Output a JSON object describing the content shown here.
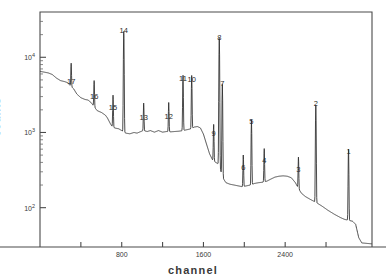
{
  "chart_data": {
    "type": "line",
    "title": "",
    "xlabel": "channel",
    "ylabel": "counts",
    "yscale": "log",
    "xlim": [
      0,
      3250
    ],
    "ylim": [
      30,
      40000
    ],
    "grid": false,
    "legend": null,
    "y_ticks": [
      {
        "value": 100,
        "label": "10",
        "exp": "2"
      },
      {
        "value": 1000,
        "label": "10",
        "exp": "3"
      },
      {
        "value": 10000,
        "label": "10",
        "exp": "4"
      }
    ],
    "y_minor_ticks": [
      200,
      300,
      400,
      500,
      600,
      700,
      800,
      900,
      2000,
      3000,
      4000,
      5000,
      6000,
      7000,
      8000,
      9000,
      20000,
      30000
    ],
    "x_ticks": [
      {
        "value": 400,
        "label": ""
      },
      {
        "value": 800,
        "label": "800"
      },
      {
        "value": 1200,
        "label": ""
      },
      {
        "value": 1600,
        "label": "1600"
      },
      {
        "value": 2000,
        "label": ""
      },
      {
        "value": 2400,
        "label": "2400"
      },
      {
        "value": 2800,
        "label": ""
      }
    ],
    "peaks": [
      {
        "id": "1",
        "channel": 3020,
        "height": 530,
        "label_y": 460
      },
      {
        "id": "2",
        "channel": 2700,
        "height": 2200,
        "label_y": 2000
      },
      {
        "id": "3",
        "channel": 2530,
        "height": 290,
        "label_y": 265
      },
      {
        "id": "4",
        "channel": 2195,
        "height": 390,
        "label_y": 350
      },
      {
        "id": "5",
        "channel": 2070,
        "height": 1280,
        "label_y": 1150
      },
      {
        "id": "6",
        "channel": 1990,
        "height": 310,
        "label_y": 280
      },
      {
        "id": "7",
        "channel": 1785,
        "height": 4100,
        "label_y": 3700
      },
      {
        "id": "8",
        "channel": 1755,
        "height": 17500,
        "label_y": 15000
      },
      {
        "id": "9",
        "channel": 1700,
        "height": 860,
        "label_y": 790
      },
      {
        "id": "10",
        "channel": 1485,
        "height": 4600,
        "label_y": 4150
      },
      {
        "id": "11",
        "channel": 1400,
        "height": 4700,
        "label_y": 4250
      },
      {
        "id": "12",
        "channel": 1260,
        "height": 1480,
        "label_y": 1350
      },
      {
        "id": "13",
        "channel": 1015,
        "height": 1400,
        "label_y": 1280
      },
      {
        "id": "14",
        "channel": 820,
        "height": 21000,
        "label_y": 18500
      },
      {
        "id": "15",
        "channel": 715,
        "height": 1960,
        "label_y": 1780
      },
      {
        "id": "16",
        "channel": 530,
        "height": 2700,
        "label_y": 2450
      },
      {
        "id": "17",
        "channel": 305,
        "height": 4250,
        "label_y": 3850
      }
    ],
    "continuum": [
      [
        0,
        6500
      ],
      [
        40,
        6350
      ],
      [
        80,
        6200
      ],
      [
        120,
        5900
      ],
      [
        160,
        5300
      ],
      [
        200,
        4900
      ],
      [
        240,
        4750
      ],
      [
        270,
        4600
      ],
      [
        300,
        4150
      ],
      [
        330,
        3800
      ],
      [
        360,
        3250
      ],
      [
        400,
        2900
      ],
      [
        440,
        2750
      ],
      [
        470,
        2700
      ],
      [
        500,
        2500
      ],
      [
        530,
        2200
      ],
      [
        560,
        1950
      ],
      [
        600,
        1850
      ],
      [
        640,
        1700
      ],
      [
        660,
        1560
      ],
      [
        690,
        1300
      ],
      [
        710,
        1180
      ],
      [
        740,
        1140
      ],
      [
        770,
        1120
      ],
      [
        800,
        1060
      ],
      [
        840,
        980
      ],
      [
        880,
        960
      ],
      [
        920,
        1000
      ],
      [
        950,
        980
      ],
      [
        980,
        1020
      ],
      [
        1010,
        1060
      ],
      [
        1050,
        1030
      ],
      [
        1080,
        1060
      ],
      [
        1120,
        1010
      ],
      [
        1160,
        1060
      ],
      [
        1200,
        1010
      ],
      [
        1240,
        1030
      ],
      [
        1280,
        1020
      ],
      [
        1320,
        1030
      ],
      [
        1360,
        1040
      ],
      [
        1400,
        1060
      ],
      [
        1440,
        1090
      ],
      [
        1480,
        1120
      ],
      [
        1510,
        1180
      ],
      [
        1540,
        1200
      ],
      [
        1570,
        1150
      ],
      [
        1600,
        950
      ],
      [
        1630,
        700
      ],
      [
        1660,
        520
      ],
      [
        1690,
        430
      ],
      [
        1720,
        400
      ],
      [
        1750,
        380
      ],
      [
        1790,
        250
      ],
      [
        1820,
        215
      ],
      [
        1860,
        205
      ],
      [
        1900,
        200
      ],
      [
        1940,
        195
      ],
      [
        1980,
        190
      ],
      [
        2020,
        195
      ],
      [
        2060,
        200
      ],
      [
        2100,
        210
      ],
      [
        2140,
        215
      ],
      [
        2180,
        218
      ],
      [
        2220,
        225
      ],
      [
        2260,
        240
      ],
      [
        2300,
        255
      ],
      [
        2340,
        262
      ],
      [
        2380,
        265
      ],
      [
        2420,
        262
      ],
      [
        2460,
        250
      ],
      [
        2500,
        215
      ],
      [
        2530,
        180
      ],
      [
        2560,
        155
      ],
      [
        2600,
        140
      ],
      [
        2650,
        128
      ],
      [
        2700,
        118
      ],
      [
        2760,
        105
      ],
      [
        2820,
        92
      ],
      [
        2880,
        82
      ],
      [
        2940,
        74
      ],
      [
        2980,
        70
      ],
      [
        3020,
        68
      ],
      [
        3060,
        66
      ],
      [
        3090,
        60
      ],
      [
        3120,
        40
      ],
      [
        3150,
        34
      ],
      [
        3250,
        33
      ]
    ]
  },
  "axes": {
    "x_axis_title": "channel",
    "y_axis_title": "counts"
  }
}
